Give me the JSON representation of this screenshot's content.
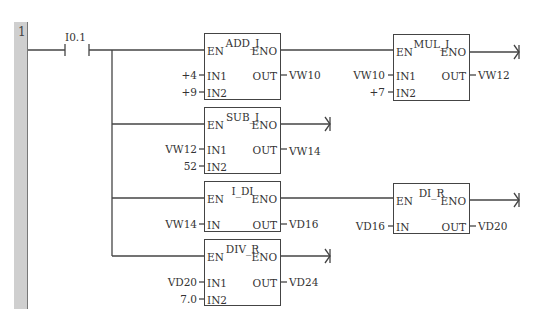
{
  "network": {
    "number": "1"
  },
  "contact": {
    "address": "I0.1"
  },
  "blocks": [
    {
      "id": "add_i",
      "title": "ADD_I",
      "en": "EN",
      "eno": "ENO",
      "inputs": [
        {
          "pin": "IN1",
          "value": "+4"
        },
        {
          "pin": "IN2",
          "value": "+9"
        }
      ],
      "out": {
        "pin": "OUT",
        "value": "VW10"
      }
    },
    {
      "id": "mul_i",
      "title": "MUL_I",
      "en": "EN",
      "eno": "ENO",
      "inputs": [
        {
          "pin": "IN1",
          "value": "VW10"
        },
        {
          "pin": "IN2",
          "value": "+7"
        }
      ],
      "out": {
        "pin": "OUT",
        "value": "VW12"
      }
    },
    {
      "id": "sub_i",
      "title": "SUB_I",
      "en": "EN",
      "eno": "ENO",
      "inputs": [
        {
          "pin": "IN1",
          "value": "VW12"
        },
        {
          "pin": "IN2",
          "value": "52"
        }
      ],
      "out": {
        "pin": "OUT",
        "value": "VW14"
      }
    },
    {
      "id": "i_di",
      "title": "I_DI",
      "en": "EN",
      "eno": "ENO",
      "inputs": [
        {
          "pin": "IN",
          "value": "VW14"
        }
      ],
      "out": {
        "pin": "OUT",
        "value": "VD16"
      }
    },
    {
      "id": "di_r",
      "title": "DI_R",
      "en": "EN",
      "eno": "ENO",
      "inputs": [
        {
          "pin": "IN",
          "value": "VD16"
        }
      ],
      "out": {
        "pin": "OUT",
        "value": "VD20"
      }
    },
    {
      "id": "div_r",
      "title": "DIV_R",
      "en": "EN",
      "eno": "ENO",
      "inputs": [
        {
          "pin": "IN1",
          "value": "VD20"
        },
        {
          "pin": "IN2",
          "value": "7.0"
        }
      ],
      "out": {
        "pin": "OUT",
        "value": "VD24"
      }
    }
  ]
}
